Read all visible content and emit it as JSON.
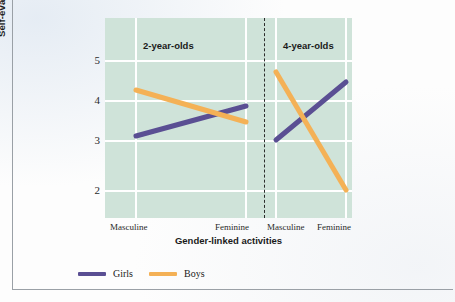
{
  "chart_data": {
    "type": "line",
    "title": "",
    "xlabel": "Gender-linked activities",
    "ylabel": "Self-evaluative reactions",
    "ylim": [
      1.5,
      5.4
    ],
    "yticks": [
      5,
      4,
      3,
      2
    ],
    "ytick_labels": [
      "5",
      "4",
      "3",
      "2"
    ],
    "grid": true,
    "legend_position": "bottom-left",
    "panels": [
      {
        "title": "2-year-olds",
        "categories": [
          "Masculine",
          "Feminine"
        ],
        "series": [
          {
            "name": "Girls",
            "color": "#5a4f93",
            "values": [
              3.1,
              3.85
            ]
          },
          {
            "name": "Boys",
            "color": "#f4b156",
            "values": [
              4.25,
              3.45
            ]
          }
        ]
      },
      {
        "title": "4-year-olds",
        "categories": [
          "Masculine",
          "Feminine"
        ],
        "series": [
          {
            "name": "Girls",
            "color": "#5a4f93",
            "values": [
              3.0,
              4.45
            ]
          },
          {
            "name": "Boys",
            "color": "#f4b156",
            "values": [
              4.7,
              2.0
            ]
          }
        ]
      }
    ],
    "legend": [
      {
        "label": "Girls",
        "color": "#5a4f93"
      },
      {
        "label": "Boys",
        "color": "#f4b156"
      }
    ],
    "colors": {
      "plot_background": "#cfe3d9",
      "gridline": "#ffffff",
      "girls": "#5a4f93",
      "boys": "#f4b156",
      "divider": "#2b2b2b",
      "text": "#1a1a1a"
    }
  },
  "axis": {
    "ytick_0": "5",
    "ytick_1": "4",
    "ytick_2": "3",
    "ytick_3": "2",
    "xtick_0": "Masculine",
    "xtick_1": "Feminine",
    "xtick_2": "Masculine",
    "xtick_3": "Feminine",
    "xlabel": "Gender-linked activities",
    "ylabel": "Self-evaluative reactions"
  },
  "panel_titles": {
    "left": "2-year-olds",
    "right": "4-year-olds"
  },
  "legend": {
    "girls": "Girls",
    "boys": "Boys"
  }
}
